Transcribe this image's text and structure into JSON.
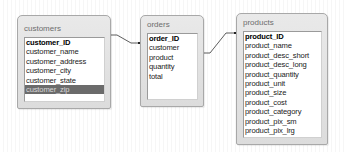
{
  "colors": {
    "box_bg": "#e2e2e2",
    "box_border": "#a8a8a8",
    "list_bg": "#ffffff",
    "selected_row_bg": "#6b6b6b",
    "selected_row_text": "#d8d8d8",
    "link_line": "#333333"
  },
  "tables": {
    "customers": {
      "title": "customers",
      "fields": [
        "customer_ID",
        "customer_name",
        "customer_address",
        "customer_city",
        "customer_state",
        "customer_zip"
      ],
      "primary_key": "customer_ID",
      "selected": "customer_zip"
    },
    "orders": {
      "title": "orders",
      "fields": [
        "order_ID",
        "customer",
        "product",
        "quantity",
        "total"
      ],
      "primary_key": "order_ID"
    },
    "products": {
      "title": "products",
      "fields": [
        "product_ID",
        "product_name",
        "product_desc_short",
        "product_desc_long",
        "product_quantity",
        "product_unit",
        "product_size",
        "product_cost",
        "product_category",
        "product_pix_sm",
        "product_pix_lrg"
      ],
      "primary_key": "product_ID"
    }
  },
  "relationships": [
    {
      "from": "customers.customer_ID",
      "to": "orders.customer"
    },
    {
      "from": "orders.product",
      "to": "products.product_ID"
    }
  ]
}
